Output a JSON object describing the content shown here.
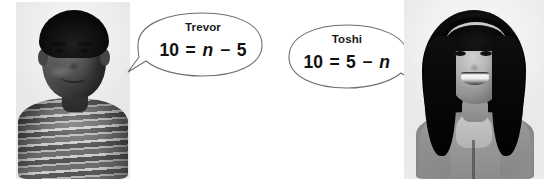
{
  "scene": {
    "width": 544,
    "height": 179,
    "background_color": "#ffffff",
    "description": "Two students shown in grayscale photos, each with a speech bubble containing an equation"
  },
  "speakers": [
    {
      "id": "trevor",
      "name": "Trevor",
      "photo_alt": "Boy in horizontally striped shirt, smiling",
      "bubble": {
        "tail_direction": "lower-left",
        "outline_color": "#6e6e6e",
        "fill_color": "#ffffff"
      },
      "equation": {
        "full": "10 = n - 5",
        "left": "10",
        "equals": "=",
        "variable": "n",
        "operator": "−",
        "right": "5"
      }
    },
    {
      "id": "toshi",
      "name": "Toshi",
      "photo_alt": "Girl with long dark hair and headband, wearing a gray hoodie, smiling",
      "bubble": {
        "tail_direction": "lower-right",
        "outline_color": "#6e6e6e",
        "fill_color": "#ffffff"
      },
      "equation": {
        "full": "10 = 5 - n",
        "left": "10",
        "equals": "=",
        "first_term": "5",
        "operator": "−",
        "variable": "n"
      }
    }
  ],
  "colors": {
    "text": "#111111",
    "bubble_outline": "#6e6e6e",
    "page_background": "#ffffff"
  }
}
